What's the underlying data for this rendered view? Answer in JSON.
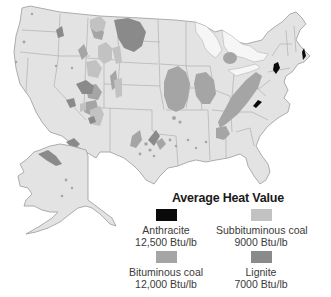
{
  "map": {
    "title": "US coal deposits by rank",
    "regions": [
      "contiguous-united-states",
      "alaska"
    ],
    "colors": {
      "land": "#e3e3e3",
      "border": "#9a9a9a",
      "water": "#ffffff",
      "great_lakes": "#f6f6f6"
    }
  },
  "legend": {
    "title": "Average Heat Value",
    "items": [
      {
        "name": "Anthracite",
        "value": "12,500 Btu/lb",
        "color": "#0a0a0a"
      },
      {
        "name": "Subbituminous coal",
        "value": "9000 Btu/lb",
        "color": "#c2c2c2"
      },
      {
        "name": "Bituminous coal",
        "value": "12,000 Btu/lb",
        "color": "#a5a5a5"
      },
      {
        "name": "Lignite",
        "value": "7000 Btu/lb",
        "color": "#8a8a8a"
      }
    ]
  }
}
